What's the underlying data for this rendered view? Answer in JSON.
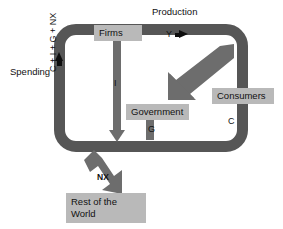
{
  "diagram": {
    "type": "circular-flow",
    "colors": {
      "ring": "#565656",
      "flow_arrow": "#6d6d6d",
      "label_box": "#b9b9b9",
      "text": "#111111",
      "accent_arrow": "#0d0d0d",
      "background": "#ffffff"
    },
    "external_labels": {
      "production": "Production",
      "spending": "Spending"
    },
    "nodes": [
      {
        "id": "firms",
        "label": "Firms"
      },
      {
        "id": "government",
        "label": "Government"
      },
      {
        "id": "consumers",
        "label": "Consumers"
      },
      {
        "id": "row",
        "label": "Rest of the World"
      }
    ],
    "node_labels": {
      "firms": "Firms",
      "government": "Government",
      "consumers": "Consumers",
      "row_line1": "Rest of the",
      "row_line2": "World"
    },
    "flows": [
      {
        "id": "y",
        "label": "Y",
        "from": "firms",
        "to": "consumers",
        "description": "output / income"
      },
      {
        "id": "c",
        "label": "C",
        "from": "consumers",
        "to": "ring",
        "description": "consumption"
      },
      {
        "id": "i",
        "label": "I",
        "from": "firms",
        "to": "ring",
        "description": "investment"
      },
      {
        "id": "g",
        "label": "G",
        "from": "government",
        "to": "ring",
        "description": "government spending"
      },
      {
        "id": "nx",
        "label": "NX",
        "from": "ring",
        "to": "row",
        "description": "net exports"
      },
      {
        "id": "total",
        "label": "C + I + G + NX",
        "from": "ring",
        "to": "firms",
        "description": "total spending"
      }
    ],
    "flow_labels": {
      "y": "Y",
      "c": "C",
      "i": "I",
      "g": "G",
      "nx": "NX",
      "total": "C + I + G + NX"
    }
  }
}
